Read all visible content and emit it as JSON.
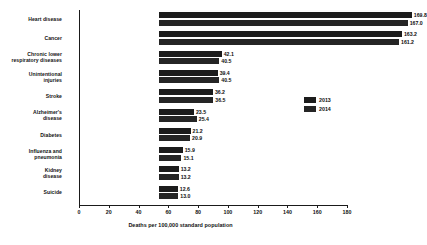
{
  "chart_data": {
    "type": "bar",
    "orientation": "horizontal",
    "title": "",
    "xlabel": "Deaths per 100,000 standard population",
    "ylabel": "",
    "xlim": [
      0,
      180
    ],
    "xticks": [
      0,
      20,
      40,
      60,
      80,
      100,
      120,
      140,
      160,
      180
    ],
    "grid": false,
    "legend_position": "right",
    "categories": [
      "Heart disease",
      "Cancer",
      "Chronic lower respiratory diseases",
      "Unintentional injuries",
      "Stroke",
      "Alzheimer's disease",
      "Diabetes",
      "Influenza and pneumonia",
      "Kidney disease",
      "Suicide"
    ],
    "category_lines": [
      [
        "Heart disease"
      ],
      [
        "Cancer"
      ],
      [
        "Chronic lower",
        "respiratory diseases"
      ],
      [
        "Unintentional",
        "injuries"
      ],
      [
        "Stroke"
      ],
      [
        "Alzheimer's",
        "disease"
      ],
      [
        "Diabetes"
      ],
      [
        "Influenza and",
        "pneumonia"
      ],
      [
        "Kidney",
        "disease"
      ],
      [
        "Suicide"
      ]
    ],
    "series": [
      {
        "name": "2013",
        "color": "#1c1c1c",
        "values": [
          169.8,
          163.2,
          42.1,
          39.4,
          36.2,
          23.5,
          21.2,
          15.9,
          13.2,
          12.6
        ]
      },
      {
        "name": "2014",
        "color": "#252525",
        "values": [
          167.0,
          161.2,
          40.5,
          40.5,
          36.5,
          25.4,
          20.9,
          15.1,
          13.2,
          13.0
        ]
      }
    ],
    "value_labels": {
      "2013": [
        "169.8",
        "163.2",
        "42.1",
        "39.4",
        "36.2",
        "23.5",
        "21.2",
        "15.9",
        "13.2",
        "12.6"
      ],
      "2014": [
        "167.0",
        "161.2",
        "40.5",
        "40.5",
        "36.5",
        "25.4",
        "20.9",
        "15.1",
        "13.2",
        "13.0"
      ]
    }
  },
  "legend": {
    "items": [
      {
        "label": "2013",
        "color": "#1c1c1c"
      },
      {
        "label": "2014",
        "color": "#252525"
      }
    ]
  }
}
